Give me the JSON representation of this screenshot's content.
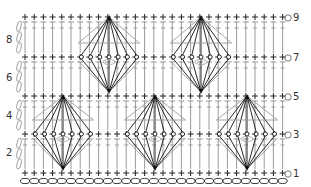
{
  "diagram": {
    "type": "crochet-stitch-chart",
    "colors": {
      "stitch": "#222222",
      "column_line": "#9a9a9a",
      "fan_line": "#111111",
      "label": "#333333",
      "background": "#ffffff"
    },
    "grid": {
      "columns": 29,
      "x_start": 25,
      "x_step": 9.2
    },
    "foundation_chain": {
      "y": 181,
      "count": 29
    },
    "rows": [
      {
        "number": "1",
        "y": 173,
        "side": "right",
        "label_x": 290
      },
      {
        "number": "2",
        "y": 152,
        "side": "left",
        "label_x": 17
      },
      {
        "number": "3",
        "y": 134,
        "side": "right",
        "label_x": 290
      },
      {
        "number": "4",
        "y": 115,
        "side": "left",
        "label_x": 17
      },
      {
        "number": "5",
        "y": 96,
        "side": "right",
        "label_x": 290
      },
      {
        "number": "6",
        "y": 77,
        "side": "left",
        "label_x": 17
      },
      {
        "number": "7",
        "y": 57,
        "side": "right",
        "label_x": 290
      },
      {
        "number": "8",
        "y": 39,
        "side": "left",
        "label_x": 17
      },
      {
        "number": "9",
        "y": 17,
        "side": "right",
        "label_x": 290
      }
    ],
    "sc_rows_y": [
      173,
      134,
      96,
      57,
      17
    ],
    "tall_stitch_bands": [
      {
        "top": 134,
        "bottom": 173
      },
      {
        "top": 96,
        "bottom": 134
      },
      {
        "top": 57,
        "bottom": 96
      },
      {
        "top": 17,
        "bottom": 57
      }
    ],
    "fans": [
      {
        "cx": 63,
        "apex_top": 96,
        "apex_bottom": 173,
        "mid": 134
      },
      {
        "cx": 155,
        "apex_top": 96,
        "apex_bottom": 173,
        "mid": 134
      },
      {
        "cx": 247,
        "apex_top": 96,
        "apex_bottom": 173,
        "mid": 134
      },
      {
        "cx": 109,
        "apex_top": 17,
        "apex_bottom": 96,
        "mid": 57
      },
      {
        "cx": 201,
        "apex_top": 17,
        "apex_bottom": 96,
        "mid": 57
      }
    ],
    "legend_symbols": {
      "sc": "plus-icon",
      "chain": "oval-icon",
      "dc": "t-stitch-icon",
      "turning_chain": "chain-loop-icon"
    }
  }
}
